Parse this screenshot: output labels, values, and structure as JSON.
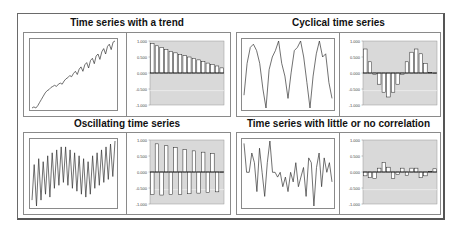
{
  "figure": {
    "panels": [
      {
        "id": "trend",
        "title": "Time series with a trend"
      },
      {
        "id": "cyclical",
        "title": "Cyclical time series"
      },
      {
        "id": "oscillating",
        "title": "Oscillating time series"
      },
      {
        "id": "uncorrelated",
        "title": "Time series with little or no correlation"
      }
    ],
    "acf_yticks": [
      "1.000",
      "0.500",
      "0.000",
      "-0.500",
      "-1.000"
    ],
    "colors": {
      "plot_bg": "#d9d9d9",
      "bar_fill": "#ffffff",
      "line": "#333333",
      "frame": "#8a8a8a"
    }
  },
  "chart_data": [
    {
      "type": "line",
      "title": "Time series with a trend",
      "xlabel": "",
      "ylabel": "",
      "y": [
        0,
        1,
        0,
        2,
        5,
        8,
        11,
        14,
        16,
        17,
        19,
        20,
        21,
        20,
        22,
        23,
        22,
        25,
        27,
        28,
        30,
        29,
        32,
        34,
        31,
        36,
        38,
        34,
        40,
        42,
        37,
        44,
        46,
        41,
        48,
        50,
        45,
        52,
        55,
        50,
        57,
        59,
        54,
        61,
        62
      ]
    },
    {
      "type": "bar",
      "title": "Time series with a trend - autocorrelation",
      "categories": [
        "1",
        "2",
        "3",
        "4",
        "5",
        "6",
        "7",
        "8",
        "9",
        "10",
        "11",
        "12",
        "13",
        "14",
        "15",
        "16"
      ],
      "values": [
        0.92,
        0.85,
        0.8,
        0.74,
        0.68,
        0.63,
        0.58,
        0.54,
        0.5,
        0.46,
        0.41,
        0.36,
        0.31,
        0.27,
        0.22,
        0.16
      ],
      "ylim": [
        -1,
        1
      ]
    },
    {
      "type": "line",
      "title": "Cyclical time series",
      "y": [
        0.1,
        0.6,
        0.85,
        0.9,
        0.8,
        0.6,
        0.2,
        -0.1,
        0.5,
        0.7,
        0.8,
        0.95,
        0.6,
        0.4,
        0.05,
        0.45,
        0.8,
        0.85,
        0.95,
        0.7,
        0.3,
        -0.1,
        0.4,
        0.75,
        0.95,
        0.7,
        0.75,
        0.3,
        0.05
      ]
    },
    {
      "type": "bar",
      "title": "Cyclical time series - autocorrelation",
      "categories": [
        "1",
        "2",
        "3",
        "4",
        "5",
        "6",
        "7",
        "8",
        "9",
        "10",
        "11",
        "12",
        "13",
        "14",
        "15",
        "16"
      ],
      "values": [
        0.75,
        0.35,
        -0.05,
        -0.35,
        -0.6,
        -0.75,
        -0.6,
        -0.35,
        -0.05,
        0.35,
        0.65,
        0.75,
        0.6,
        0.3,
        0.02,
        0.0
      ],
      "ylim": [
        -1,
        1
      ]
    },
    {
      "type": "line",
      "title": "Oscillating time series",
      "y": [
        0.2,
        0.8,
        0.1,
        0.9,
        0.2,
        0.85,
        0.3,
        0.95,
        0.25,
        1.0,
        0.4,
        1.05,
        0.45,
        1.1,
        0.5,
        1.1,
        0.45,
        1.05,
        0.4,
        1.0,
        0.35,
        0.95,
        0.3,
        0.9,
        0.25,
        0.85,
        0.3,
        0.95,
        0.4,
        1.0,
        0.45,
        1.05,
        0.5,
        1.1,
        0.55,
        1.15,
        0.6,
        1.2
      ]
    },
    {
      "type": "bar",
      "title": "Oscillating time series - autocorrelation",
      "categories": [
        "1",
        "2",
        "3",
        "4",
        "5",
        "6",
        "7",
        "8",
        "9",
        "10",
        "11",
        "12",
        "13",
        "14",
        "15",
        "16"
      ],
      "values": [
        -0.7,
        0.88,
        -0.72,
        0.82,
        -0.7,
        0.76,
        -0.7,
        0.7,
        -0.68,
        0.66,
        -0.66,
        0.62,
        -0.64,
        0.58,
        -0.62,
        0.0
      ],
      "ylim": [
        -1,
        1
      ]
    },
    {
      "type": "line",
      "title": "Time series with little or no correlation",
      "y": [
        0.9,
        0.3,
        0.3,
        0.7,
        0.5,
        -0.1,
        0.8,
        0.3,
        -0.2,
        0.5,
        0.95,
        0.3,
        0.3,
        0.2,
        0.3,
        0.0,
        0.2,
        -0.1,
        0.3,
        0.1,
        0.5,
        0.0,
        0.2,
        0.4,
        -0.2,
        0.6,
        0.5,
        -0.4,
        0.4,
        0.7,
        0.0,
        0.6,
        0.3,
        0.5,
        0.1
      ]
    },
    {
      "type": "bar",
      "title": "Time series with little or no correlation - autocorrelation",
      "categories": [
        "1",
        "2",
        "3",
        "4",
        "5",
        "6",
        "7",
        "8",
        "9",
        "10",
        "11",
        "12",
        "13",
        "14",
        "15",
        "16"
      ],
      "values": [
        -0.12,
        -0.18,
        -0.2,
        0.12,
        0.3,
        0.15,
        -0.2,
        -0.08,
        0.12,
        -0.1,
        0.12,
        0.12,
        -0.18,
        -0.12,
        0.02,
        0.1
      ],
      "ylim": [
        -1,
        1
      ]
    }
  ]
}
